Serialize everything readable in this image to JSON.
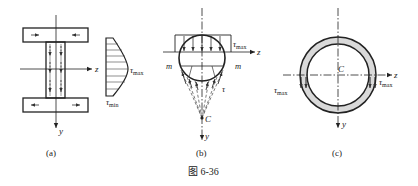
{
  "figure": {
    "caption": "图 6-36",
    "panels": {
      "a": {
        "label": "(a)",
        "axis_z": "z",
        "axis_y": "y",
        "tau_max": "τ",
        "tau_max_sub": "max",
        "tau_min": "τ",
        "tau_min_sub": "min"
      },
      "b": {
        "label": "(b)",
        "axis_z": "z",
        "axis_y": "y",
        "tau_max": "τ",
        "tau_max_sub": "max",
        "m_left": "m",
        "m_right": "m",
        "tau": "τ",
        "centroid": "C"
      },
      "c": {
        "label": "(c)",
        "axis_z": "z",
        "axis_y": "y",
        "centroid": "C",
        "tau_max_left": "τ",
        "tau_max_left_sub": "max",
        "tau_max_right": "τ",
        "tau_max_right_sub": "max"
      }
    },
    "colors": {
      "line": "#222222",
      "ring_fill": "#d9d9d9"
    }
  }
}
